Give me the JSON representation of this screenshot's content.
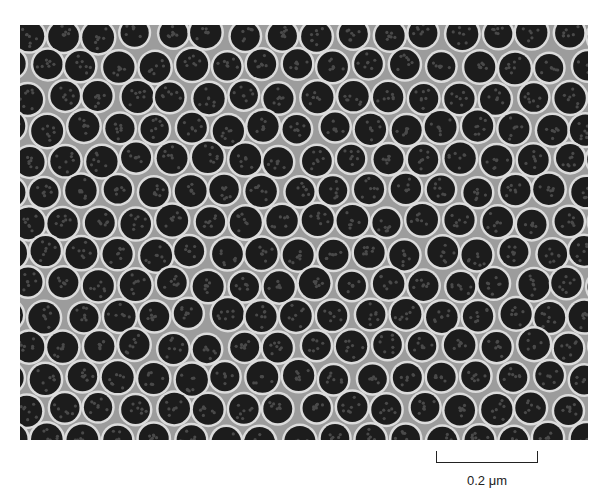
{
  "figure": {
    "type": "electron-micrograph",
    "colors": {
      "background": "#9c9c9c",
      "halo": "#dcdcdc",
      "particle": "#1c1c1c",
      "texture": "#4a4a4a"
    },
    "lattice": {
      "spacing": 36,
      "radius": 15,
      "rows": 13,
      "cols": 17
    }
  },
  "scale_bar": {
    "label": "0.2 μm",
    "length_px": 102
  }
}
